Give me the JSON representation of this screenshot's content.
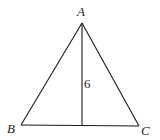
{
  "figure": {
    "type": "triangle-with-altitude",
    "vertices": {
      "A": {
        "label": "A",
        "x": 82,
        "y": 23
      },
      "B": {
        "label": "B",
        "x": 21,
        "y": 125
      },
      "C": {
        "label": "C",
        "x": 139,
        "y": 126
      }
    },
    "altitude": {
      "from": "A",
      "foot": {
        "x": 82,
        "y": 125
      },
      "length_label": "6"
    },
    "stroke_color": "#1a1a1a",
    "background": "#ffffff"
  }
}
